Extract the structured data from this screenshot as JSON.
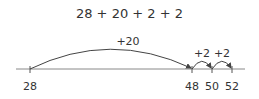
{
  "expression": "28 + 20 + 2 + 2",
  "number_line": {
    "ticks": [
      {
        "value": 28,
        "label": "28",
        "x": 30
      },
      {
        "value": 48,
        "label": "48",
        "x": 192
      },
      {
        "value": 50,
        "label": "50",
        "x": 212
      },
      {
        "value": 52,
        "label": "52",
        "x": 232
      }
    ],
    "jumps": [
      {
        "from": 28,
        "to": 48,
        "label": "+20"
      },
      {
        "from": 48,
        "to": 50,
        "label": "+2"
      },
      {
        "from": 50,
        "to": 52,
        "label": "+2"
      }
    ]
  },
  "colors": {
    "line": "#555555",
    "text": "#333333"
  }
}
